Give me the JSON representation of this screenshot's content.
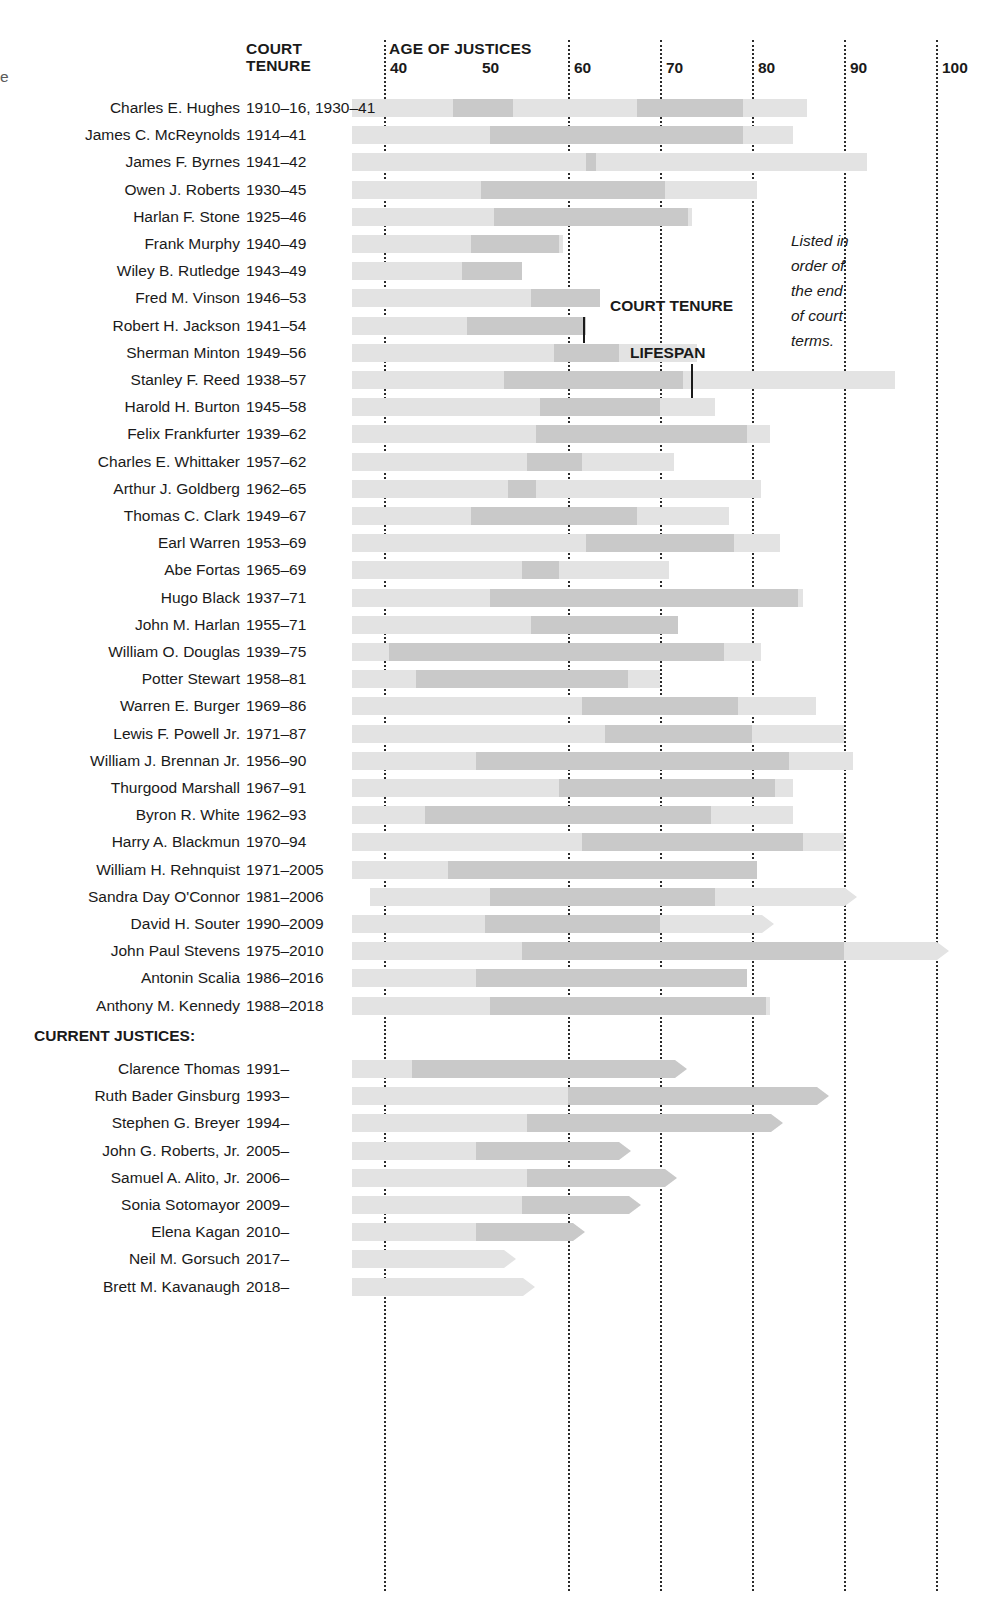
{
  "header": {
    "court_tenure_label_line1": "COURT",
    "court_tenure_label_line2": "TENURE",
    "age_axis_label": "AGE OF JUSTICES"
  },
  "annotations": {
    "court_tenure_callout": "COURT TENURE",
    "lifespan_callout": "LIFESPAN",
    "note_lines": [
      "Listed in",
      "order of",
      "the end",
      "of court",
      "terms."
    ],
    "section_current": "CURRENT JUSTICES:"
  },
  "colors": {
    "lifespan_bar": "#e3e3e3",
    "tenure_bar": "#c9c9c9",
    "gridline": "#2b2b2b",
    "text": "#1a1a1a"
  },
  "chart_data": {
    "type": "bar",
    "xlabel": "AGE OF JUSTICES",
    "ylabel": "",
    "xlim": [
      36.5,
      104
    ],
    "xticks": [
      40,
      50,
      60,
      70,
      80,
      90,
      100
    ],
    "xtick_labels": [
      "40",
      "50",
      "60",
      "70",
      "80",
      "90",
      "100"
    ],
    "gridlines_at": [
      40,
      60,
      70,
      80,
      90,
      100
    ],
    "grid": true,
    "legend": [
      "COURT TENURE",
      "LIFESPAN"
    ],
    "legend_position": "inline-callout",
    "series_note": "Each row: light bar = lifespan (age range), dark segment(s) = court tenure (age range); arrow tip = still living / still serving.",
    "columns": [
      "name",
      "court_tenure",
      "lifespan_start_age",
      "lifespan_end_age",
      "tenure_age_spans",
      "living"
    ],
    "rows": [
      {
        "name": "Charles E. Hughes",
        "court_tenure": "1910–16, 1930–41",
        "lifespan_start_age": 36.5,
        "lifespan_end_age": 86.0,
        "tenure_age_spans": [
          [
            47.5,
            54.0
          ],
          [
            67.5,
            79.0
          ]
        ],
        "living": false
      },
      {
        "name": "James C. McReynolds",
        "court_tenure": "1914–41",
        "lifespan_start_age": 36.5,
        "lifespan_end_age": 84.5,
        "tenure_age_spans": [
          [
            51.5,
            79.0
          ]
        ],
        "living": false
      },
      {
        "name": "James F. Byrnes",
        "court_tenure": "1941–42",
        "lifespan_start_age": 36.5,
        "lifespan_end_age": 92.5,
        "tenure_age_spans": [
          [
            62.0,
            63.0
          ]
        ],
        "living": false
      },
      {
        "name": "Owen J. Roberts",
        "court_tenure": "1930–45",
        "lifespan_start_age": 36.5,
        "lifespan_end_age": 80.5,
        "tenure_age_spans": [
          [
            50.5,
            70.5
          ]
        ],
        "living": false
      },
      {
        "name": "Harlan F. Stone",
        "court_tenure": "1925–46",
        "lifespan_start_age": 36.5,
        "lifespan_end_age": 73.5,
        "tenure_age_spans": [
          [
            52.0,
            73.0
          ]
        ],
        "living": false
      },
      {
        "name": "Frank Murphy",
        "court_tenure": "1940–49",
        "lifespan_start_age": 36.5,
        "lifespan_end_age": 59.5,
        "tenure_age_spans": [
          [
            49.5,
            59.0
          ]
        ],
        "living": false
      },
      {
        "name": "Wiley B. Rutledge",
        "court_tenure": "1943–49",
        "lifespan_start_age": 36.5,
        "lifespan_end_age": 55.0,
        "tenure_age_spans": [
          [
            48.5,
            55.0
          ]
        ],
        "living": false
      },
      {
        "name": "Fred M. Vinson",
        "court_tenure": "1946–53",
        "lifespan_start_age": 36.5,
        "lifespan_end_age": 63.5,
        "tenure_age_spans": [
          [
            56.0,
            63.5
          ]
        ],
        "living": false
      },
      {
        "name": "Robert H. Jackson",
        "court_tenure": "1941–54",
        "lifespan_start_age": 36.5,
        "lifespan_end_age": 62.0,
        "tenure_age_spans": [
          [
            49.0,
            62.0
          ]
        ],
        "living": false
      },
      {
        "name": "Sherman Minton",
        "court_tenure": "1949–56",
        "lifespan_start_age": 36.5,
        "lifespan_end_age": 74.0,
        "tenure_age_spans": [
          [
            58.5,
            65.5
          ]
        ],
        "living": false
      },
      {
        "name": "Stanley F. Reed",
        "court_tenure": "1938–57",
        "lifespan_start_age": 36.5,
        "lifespan_end_age": 95.5,
        "tenure_age_spans": [
          [
            53.0,
            72.5
          ]
        ],
        "living": false
      },
      {
        "name": "Harold H. Burton",
        "court_tenure": "1945–58",
        "lifespan_start_age": 36.5,
        "lifespan_end_age": 76.0,
        "tenure_age_spans": [
          [
            57.0,
            70.0
          ]
        ],
        "living": false
      },
      {
        "name": "Felix Frankfurter",
        "court_tenure": "1939–62",
        "lifespan_start_age": 36.5,
        "lifespan_end_age": 82.0,
        "tenure_age_spans": [
          [
            56.5,
            79.5
          ]
        ],
        "living": false
      },
      {
        "name": "Charles E. Whittaker",
        "court_tenure": "1957–62",
        "lifespan_start_age": 36.5,
        "lifespan_end_age": 71.5,
        "tenure_age_spans": [
          [
            55.5,
            61.5
          ]
        ],
        "living": false
      },
      {
        "name": "Arthur J. Goldberg",
        "court_tenure": "1962–65",
        "lifespan_start_age": 36.5,
        "lifespan_end_age": 81.0,
        "tenure_age_spans": [
          [
            53.5,
            56.5
          ]
        ],
        "living": false
      },
      {
        "name": "Thomas C. Clark",
        "court_tenure": "1949–67",
        "lifespan_start_age": 36.5,
        "lifespan_end_age": 77.5,
        "tenure_age_spans": [
          [
            49.5,
            67.5
          ]
        ],
        "living": false
      },
      {
        "name": "Earl Warren",
        "court_tenure": "1953–69",
        "lifespan_start_age": 36.5,
        "lifespan_end_age": 83.0,
        "tenure_age_spans": [
          [
            62.0,
            78.0
          ]
        ],
        "living": false
      },
      {
        "name": "Abe Fortas",
        "court_tenure": "1965–69",
        "lifespan_start_age": 36.5,
        "lifespan_end_age": 71.0,
        "tenure_age_spans": [
          [
            55.0,
            59.0
          ]
        ],
        "living": false
      },
      {
        "name": "Hugo Black",
        "court_tenure": "1937–71",
        "lifespan_start_age": 36.5,
        "lifespan_end_age": 85.5,
        "tenure_age_spans": [
          [
            51.5,
            85.0
          ]
        ],
        "living": false
      },
      {
        "name": "John M. Harlan",
        "court_tenure": "1955–71",
        "lifespan_start_age": 36.5,
        "lifespan_end_age": 72.0,
        "tenure_age_spans": [
          [
            56.0,
            72.0
          ]
        ],
        "living": false
      },
      {
        "name": "William O. Douglas",
        "court_tenure": "1939–75",
        "lifespan_start_age": 36.5,
        "lifespan_end_age": 81.0,
        "tenure_age_spans": [
          [
            40.5,
            77.0
          ]
        ],
        "living": false
      },
      {
        "name": "Potter Stewart",
        "court_tenure": "1958–81",
        "lifespan_start_age": 36.5,
        "lifespan_end_age": 70.0,
        "tenure_age_spans": [
          [
            43.5,
            66.5
          ]
        ],
        "living": false
      },
      {
        "name": "Warren E. Burger",
        "court_tenure": "1969–86",
        "lifespan_start_age": 36.5,
        "lifespan_end_age": 87.0,
        "tenure_age_spans": [
          [
            61.5,
            78.5
          ]
        ],
        "living": false
      },
      {
        "name": "Lewis F. Powell Jr.",
        "court_tenure": "1971–87",
        "lifespan_start_age": 36.5,
        "lifespan_end_age": 90.0,
        "tenure_age_spans": [
          [
            64.0,
            80.0
          ]
        ],
        "living": false
      },
      {
        "name": "William J. Brennan Jr.",
        "court_tenure": "1956–90",
        "lifespan_start_age": 36.5,
        "lifespan_end_age": 91.0,
        "tenure_age_spans": [
          [
            50.0,
            84.0
          ]
        ],
        "living": false
      },
      {
        "name": "Thurgood Marshall",
        "court_tenure": "1967–91",
        "lifespan_start_age": 36.5,
        "lifespan_end_age": 84.5,
        "tenure_age_spans": [
          [
            59.0,
            82.5
          ]
        ],
        "living": false
      },
      {
        "name": "Byron R. White",
        "court_tenure": "1962–93",
        "lifespan_start_age": 36.5,
        "lifespan_end_age": 84.5,
        "tenure_age_spans": [
          [
            44.5,
            75.5
          ]
        ],
        "living": false
      },
      {
        "name": "Harry A. Blackmun",
        "court_tenure": "1970–94",
        "lifespan_start_age": 36.5,
        "lifespan_end_age": 90.0,
        "tenure_age_spans": [
          [
            61.5,
            85.5
          ]
        ],
        "living": false
      },
      {
        "name": "William H. Rehnquist",
        "court_tenure": "1971–2005",
        "lifespan_start_age": 36.5,
        "lifespan_end_age": 80.5,
        "tenure_age_spans": [
          [
            47.0,
            80.5
          ]
        ],
        "living": false
      },
      {
        "name": "Sandra Day O'Connor",
        "court_tenure": "1981–2006",
        "lifespan_start_age": 38.5,
        "lifespan_end_age": 89.0,
        "tenure_age_spans": [
          [
            51.5,
            76.0
          ]
        ],
        "living": true
      },
      {
        "name": "David H. Souter",
        "court_tenure": "1990–2009",
        "lifespan_start_age": 36.5,
        "lifespan_end_age": 80.0,
        "tenure_age_spans": [
          [
            51.0,
            70.0
          ]
        ],
        "living": true
      },
      {
        "name": "John Paul Stevens",
        "court_tenure": "1975–2010",
        "lifespan_start_age": 36.5,
        "lifespan_end_age": 99.0,
        "tenure_age_spans": [
          [
            55.0,
            90.0
          ]
        ],
        "living": true
      },
      {
        "name": "Antonin Scalia",
        "court_tenure": "1986–2016",
        "lifespan_start_age": 36.5,
        "lifespan_end_age": 79.5,
        "tenure_age_spans": [
          [
            50.0,
            79.5
          ]
        ],
        "living": false
      },
      {
        "name": "Anthony M. Kennedy",
        "court_tenure": "1988–2018",
        "lifespan_start_age": 36.5,
        "lifespan_end_age": 82.0,
        "tenure_age_spans": [
          [
            51.5,
            81.5
          ]
        ],
        "living": false
      }
    ],
    "current_rows": [
      {
        "name": "Clarence Thomas",
        "court_tenure": "1991–",
        "lifespan_start_age": 36.5,
        "lifespan_end_age": 70.5,
        "tenure_age_spans": [
          [
            43.0,
            70.5
          ]
        ],
        "living": true
      },
      {
        "name": "Ruth Bader Ginsburg",
        "court_tenure": "1993–",
        "lifespan_start_age": 36.5,
        "lifespan_end_age": 86.0,
        "tenure_age_spans": [
          [
            60.0,
            86.0
          ]
        ],
        "living": true
      },
      {
        "name": "Stephen G. Breyer",
        "court_tenure": "1994–",
        "lifespan_start_age": 36.5,
        "lifespan_end_age": 81.0,
        "tenure_age_spans": [
          [
            55.5,
            81.0
          ]
        ],
        "living": true
      },
      {
        "name": "John G. Roberts, Jr.",
        "court_tenure": "2005–",
        "lifespan_start_age": 36.5,
        "lifespan_end_age": 64.5,
        "tenure_age_spans": [
          [
            50.0,
            64.5
          ]
        ],
        "living": true
      },
      {
        "name": "Samuel A. Alito, Jr.",
        "court_tenure": "2006–",
        "lifespan_start_age": 36.5,
        "lifespan_end_age": 69.5,
        "tenure_age_spans": [
          [
            55.5,
            69.5
          ]
        ],
        "living": true
      },
      {
        "name": "Sonia Sotomayor",
        "court_tenure": "2009–",
        "lifespan_start_age": 36.5,
        "lifespan_end_age": 65.5,
        "tenure_age_spans": [
          [
            55.0,
            65.5
          ]
        ],
        "living": true
      },
      {
        "name": "Elena Kagan",
        "court_tenure": "2010–",
        "lifespan_start_age": 36.5,
        "lifespan_end_age": 59.5,
        "tenure_age_spans": [
          [
            50.0,
            59.5
          ]
        ],
        "living": true
      },
      {
        "name": "Neil M. Gorsuch",
        "court_tenure": "2017–",
        "lifespan_start_age": 36.5,
        "lifespan_end_age": 52.0,
        "tenure_age_spans": [],
        "living": true
      },
      {
        "name": "Brett M. Kavanaugh",
        "court_tenure": "2018–",
        "lifespan_start_age": 36.5,
        "lifespan_end_age": 54.0,
        "tenure_age_spans": [],
        "living": true
      }
    ]
  }
}
